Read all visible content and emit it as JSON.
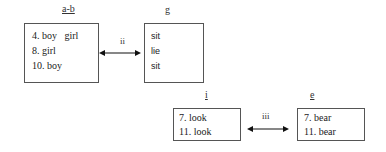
{
  "diagram": {
    "groups": [
      {
        "id": "a-b",
        "label": "a-b",
        "lines": [
          "4. boy   girl",
          "8. girl",
          "10. boy"
        ]
      },
      {
        "id": "g",
        "label": "g",
        "lines": [
          "sit",
          "lie",
          "sit"
        ]
      },
      {
        "id": "i",
        "label": "i",
        "lines": [
          "7. look",
          "11. look"
        ]
      },
      {
        "id": "e",
        "label": "e",
        "lines": [
          "7. bear",
          "11. bear"
        ]
      }
    ],
    "links": [
      {
        "from": "a-b",
        "to": "g",
        "label": "ii",
        "type": "bidirectional"
      },
      {
        "from": "i",
        "to": "e",
        "label": "iii",
        "type": "bidirectional"
      }
    ]
  }
}
